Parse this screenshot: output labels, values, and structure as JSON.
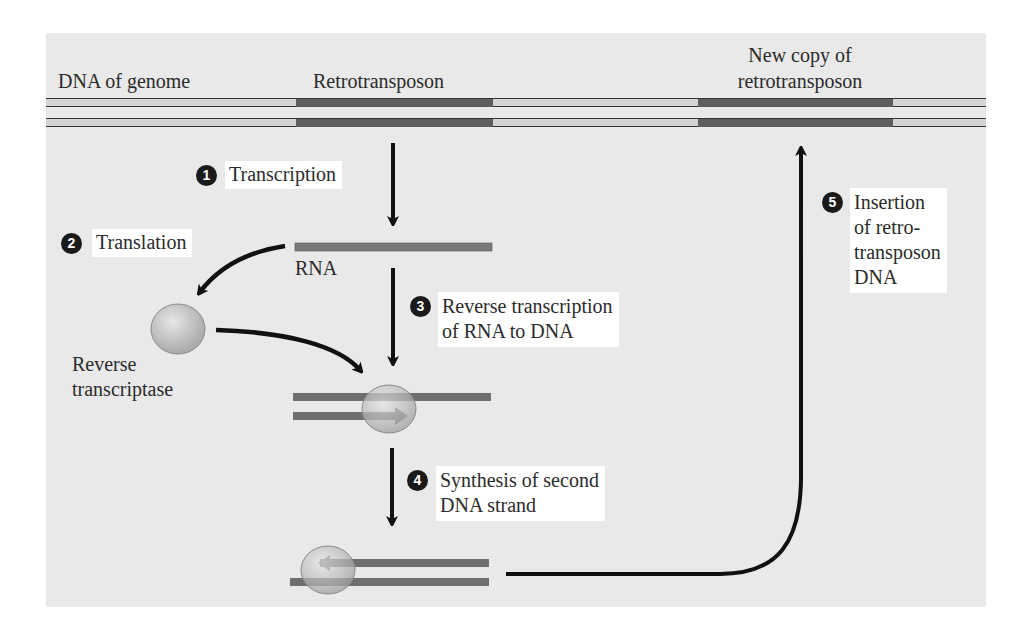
{
  "diagram": {
    "labels": {
      "dna_of_genome": "DNA of genome",
      "retrotransposon": "Retrotransposon",
      "new_copy_line1": "New copy of",
      "new_copy_line2": "retrotransposon",
      "rna": "RNA",
      "reverse_transcriptase_line1": "Reverse",
      "reverse_transcriptase_line2": "transcriptase"
    },
    "steps": [
      {
        "number": "1",
        "lines": [
          "Transcription"
        ]
      },
      {
        "number": "2",
        "lines": [
          "Translation"
        ]
      },
      {
        "number": "3",
        "lines": [
          "Reverse transcription",
          "of RNA to DNA"
        ]
      },
      {
        "number": "4",
        "lines": [
          "Synthesis of second",
          "DNA strand"
        ]
      },
      {
        "number": "5",
        "lines": [
          "Insertion",
          "of retro-",
          "transposon",
          "DNA"
        ]
      }
    ],
    "colors": {
      "background": "#e9e9e9",
      "genome_dna": "#d2d2d2",
      "retrotransposon_dna": "#5e5e5e",
      "rna_strand": "#7a7a7a",
      "enzyme": "#c9c9c9",
      "arrow": "#111111",
      "step_badge": "#1a1a1a"
    }
  }
}
